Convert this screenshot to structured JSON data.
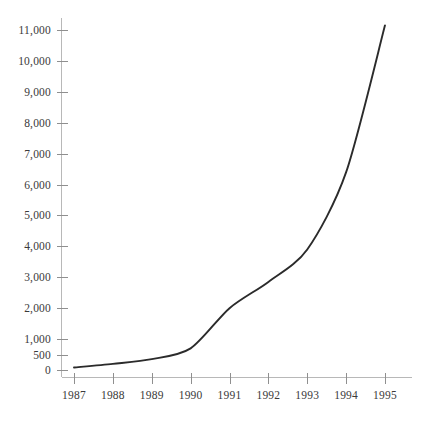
{
  "chart_data": {
    "type": "line",
    "title": "",
    "subtitle": "",
    "xlabel": "",
    "ylabel": "",
    "x": [
      1987,
      1988,
      1989,
      1990,
      1991,
      1992,
      1993,
      1994,
      1995
    ],
    "categories": [
      "1987",
      "1988",
      "1989",
      "1990",
      "1991",
      "1992",
      "1993",
      "1994",
      "1995"
    ],
    "values": [
      80,
      200,
      350,
      700,
      2000,
      2850,
      3900,
      6400,
      11150
    ],
    "series": [
      {
        "name": "",
        "values": [
          80,
          200,
          350,
          700,
          2000,
          2850,
          3900,
          6400,
          11150
        ]
      }
    ],
    "xlim": [
      1987,
      1995
    ],
    "ylim": [
      0,
      11500
    ],
    "y_ticks": [
      0,
      500,
      1000,
      2000,
      3000,
      4000,
      5000,
      6000,
      7000,
      8000,
      9000,
      10000,
      11000
    ],
    "y_tick_labels": [
      "0",
      "500",
      "1,000",
      "2,000",
      "3,000",
      "4,000",
      "5,000",
      "6,000",
      "7,000",
      "8,000",
      "9,000",
      "10,000",
      "11,000"
    ],
    "x_ticks": [
      1987,
      1988,
      1989,
      1990,
      1991,
      1992,
      1993,
      1994,
      1995
    ],
    "x_tick_labels": [
      "1987",
      "1988",
      "1989",
      "1990",
      "1991",
      "1992",
      "1993",
      "1994",
      "1995"
    ],
    "grid": false,
    "legend": false,
    "legend_position": "none",
    "annotations": [],
    "colors": {
      "background": "#ffffff",
      "line": "#2b2b2b",
      "axis": "#b8b8b8",
      "tick": "#8f8f8f",
      "text": "#3a3a3a"
    }
  }
}
